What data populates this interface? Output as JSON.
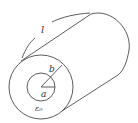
{
  "diagram": {
    "type": "coaxial-cylinder",
    "labels": {
      "length": "l",
      "outer_radius": "b",
      "inner_radius": "a",
      "permittivity": "ε₀"
    },
    "colors": {
      "stroke": "#4a4a4a",
      "text": "#333333",
      "background": "#ffffff"
    }
  }
}
